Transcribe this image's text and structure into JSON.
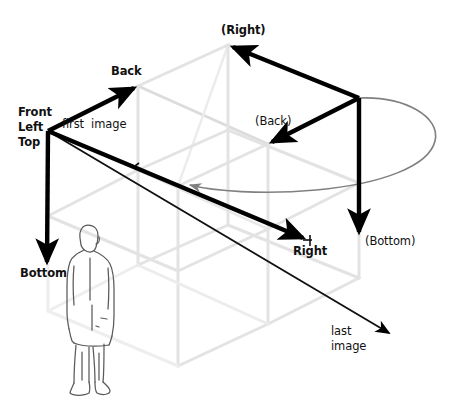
{
  "figure": {
    "type": "diagram",
    "background_color": "#ffffff",
    "width": 449,
    "height": 406
  },
  "colors": {
    "axis_arrow": "#000000",
    "wireframe": "#e2e2e2",
    "wireframe_dark": "#d2d2d2",
    "orbit_curve": "#808080",
    "person_outline": "#4a4a4a",
    "label_text": "#111111"
  },
  "labels": {
    "origin": {
      "line1": "Front",
      "line2": "Left",
      "line3": "Top",
      "x": 18,
      "y": 107
    },
    "first_image": {
      "text": "first  image",
      "x": 62,
      "y": 119
    },
    "last_image": {
      "line1": "last",
      "line2": "image",
      "x": 331,
      "y": 326
    },
    "back": {
      "text": "Back",
      "x": 112,
      "y": 66
    },
    "right": {
      "text": "Right",
      "x": 294,
      "y": 246
    },
    "bottom": {
      "text": "Bottom",
      "x": 21,
      "y": 268
    },
    "back_paren": {
      "text": "(Back)",
      "x": 256,
      "y": 116
    },
    "right_paren": {
      "text": "(Right)",
      "x": 223,
      "y": 25
    },
    "bottom_paren": {
      "text": "(Bottom)",
      "x": 366,
      "y": 236
    }
  },
  "axes": [
    {
      "name": "back-axis-arrow",
      "label": "Back",
      "from": [
        48,
        131
      ],
      "to": [
        138,
        86
      ],
      "style": "thick-black"
    },
    {
      "name": "right-axis-arrow",
      "label": "Right",
      "from": [
        48,
        131
      ],
      "to": [
        307,
        240
      ],
      "style": "thick-black"
    },
    {
      "name": "bottom-axis-arrow",
      "label": "Bottom",
      "from": [
        48,
        131
      ],
      "to": [
        47,
        267
      ],
      "style": "thick-black"
    },
    {
      "name": "back-secondary-arrow",
      "label": "(Back)",
      "from": [
        359,
        98
      ],
      "to": [
        268,
        144
      ],
      "style": "thick-black"
    },
    {
      "name": "right-secondary-arrow",
      "label": "(Right)",
      "from": [
        359,
        98
      ],
      "to": [
        228,
        45
      ],
      "style": "thick-black"
    },
    {
      "name": "bottom-secondary-arrow",
      "label": "(Bottom)",
      "from": [
        359,
        98
      ],
      "to": [
        359,
        237
      ],
      "style": "thick-black"
    },
    {
      "name": "last-image-arrow",
      "label": "last image",
      "from": [
        48,
        131
      ],
      "to": [
        393,
        335
      ],
      "style": "thin-black"
    },
    {
      "name": "orbit-arrow",
      "label": "rotation",
      "from": [
        359,
        98
      ],
      "to": [
        183,
        186
      ],
      "style": "gray-ellipse"
    }
  ],
  "wireframe": {
    "description": "Two stacked isometric slabs forming the image volume",
    "top_slab_corners": {
      "front_left_top": [
        48,
        131
      ],
      "back_left_top": [
        138,
        86
      ],
      "back_right_top": [
        228,
        45
      ],
      "right_top": [
        359,
        98
      ]
    }
  },
  "person": {
    "name": "human-figure-silhouette",
    "description": "Outline drawing of a standing man, facing away, used for scale",
    "bounds": [
      64,
      224,
      58,
      172
    ]
  }
}
